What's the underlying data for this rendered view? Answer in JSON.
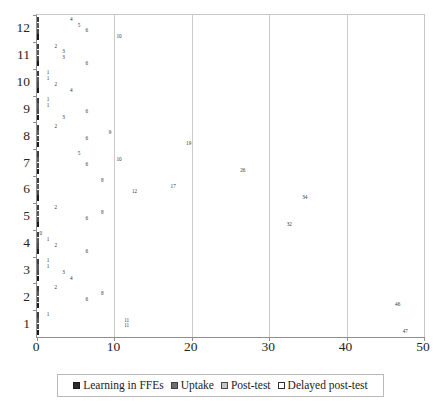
{
  "chart_data": {
    "type": "bar",
    "orientation": "horizontal",
    "title": "",
    "xlabel": "",
    "ylabel": "",
    "xlim": [
      0,
      50
    ],
    "xticks": [
      0,
      10,
      20,
      30,
      40,
      50
    ],
    "grid": "vertical",
    "legend_position": "bottom",
    "categories": [
      "1",
      "2",
      "3",
      "4",
      "5",
      "6",
      "7",
      "8",
      "9",
      "10",
      "11",
      "12"
    ],
    "series": [
      {
        "name": "Learning in FFEs",
        "color": "#2b2b2b",
        "values": [
          47,
          46,
          4,
          6,
          32,
          34,
          26,
          19,
          3,
          4,
          6,
          10
        ],
        "labels": [
          "47",
          "46",
          "4",
          "6",
          "32",
          "34",
          "26",
          "19",
          "3",
          "4",
          "6",
          "10"
        ]
      },
      {
        "name": "Uptake",
        "color": "#6f6f6f",
        "values": [
          11,
          6,
          3,
          2,
          6,
          12,
          6,
          6,
          6,
          2,
          3,
          6
        ],
        "labels": [
          "11",
          "6",
          "3",
          "2",
          "6",
          "12",
          "6",
          "6",
          "6",
          "2",
          "3",
          "6"
        ]
      },
      {
        "name": "Post-test",
        "color": "#c6c6c6",
        "values": [
          11,
          8,
          1,
          1,
          8,
          17,
          10,
          9,
          1,
          1,
          3,
          5
        ],
        "labels": [
          "11",
          "8",
          "1",
          "1",
          "8",
          "17",
          "10",
          "9",
          "1",
          "1",
          "3",
          "5"
        ]
      },
      {
        "name": "Delayed post-test",
        "color": "#ffffff",
        "values": [
          1,
          2,
          1,
          0,
          2,
          8,
          5,
          2,
          1,
          1,
          2,
          4
        ],
        "labels": [
          "1",
          "2",
          "1",
          "0",
          "2",
          "8",
          "5",
          "2",
          "1",
          "1",
          "2",
          "4"
        ]
      }
    ]
  },
  "axis": {
    "x_tick_labels": [
      "0",
      "10",
      "20",
      "30",
      "40",
      "50"
    ],
    "y_tick_labels": [
      "12",
      "11",
      "10",
      "9",
      "8",
      "7",
      "6",
      "5",
      "4",
      "3",
      "2",
      "1"
    ]
  },
  "legend": {
    "items": [
      {
        "label": "Learning in FFEs",
        "swatch": "legend-swatch-dark"
      },
      {
        "label": "Uptake",
        "swatch": "legend-swatch-mid-gray"
      },
      {
        "label": "Post-test",
        "swatch": "legend-swatch-light-gray"
      },
      {
        "label": "Delayed post-test",
        "swatch": "legend-swatch-white"
      }
    ]
  }
}
